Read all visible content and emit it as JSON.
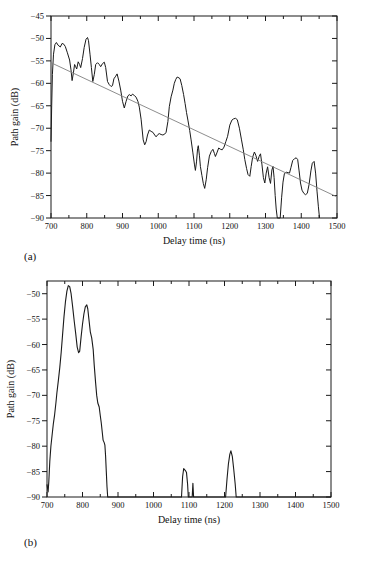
{
  "figure": {
    "panel_a_tag": "(a)",
    "panel_b_tag": "(b)",
    "ink_color": "#1a1a1a",
    "trend_color": "#808080"
  },
  "chart_data": [
    {
      "id": "a",
      "type": "line",
      "title": "",
      "xlabel": "Delay time (ns)",
      "ylabel": "Path gain (dB)",
      "xlim": [
        700,
        1500
      ],
      "ylim": [
        -90,
        -45
      ],
      "grid": false,
      "x_ticks": [
        700,
        800,
        900,
        1000,
        1100,
        1200,
        1300,
        1400,
        1500
      ],
      "x_minor_step": 50,
      "y_ticks": [
        -45,
        -50,
        -55,
        -60,
        -65,
        -70,
        -75,
        -80,
        -85,
        -90
      ],
      "series": [
        {
          "name": "measured-path-gain",
          "color": "#1a1a1a",
          "width": 1,
          "points": [
            [
              700,
              -73
            ],
            [
              702,
              -65
            ],
            [
              704,
              -58
            ],
            [
              707,
              -53.5
            ],
            [
              711,
              -51.4
            ],
            [
              715,
              -50.9
            ],
            [
              720,
              -51.5
            ],
            [
              726,
              -51.9
            ],
            [
              731,
              -51.1
            ],
            [
              736,
              -51.3
            ],
            [
              740,
              -51.8
            ],
            [
              746,
              -53.2
            ],
            [
              752,
              -54.8
            ],
            [
              756,
              -57
            ],
            [
              759,
              -59.4
            ],
            [
              763,
              -57.5
            ],
            [
              766,
              -55.8
            ],
            [
              769,
              -56.3
            ],
            [
              772,
              -56.8
            ],
            [
              776,
              -55.2
            ],
            [
              780,
              -55.8
            ],
            [
              783,
              -56.5
            ],
            [
              788,
              -54.5
            ],
            [
              793,
              -52
            ],
            [
              798,
              -50.2
            ],
            [
              802,
              -49.8
            ],
            [
              805,
              -50.5
            ],
            [
              809,
              -53.5
            ],
            [
              813,
              -56.5
            ],
            [
              817,
              -59.6
            ],
            [
              821,
              -58
            ],
            [
              825,
              -55.8
            ],
            [
              830,
              -55.4
            ],
            [
              835,
              -55.8
            ],
            [
              839,
              -56.3
            ],
            [
              844,
              -55.6
            ],
            [
              849,
              -55.3
            ],
            [
              853,
              -56.5
            ],
            [
              858,
              -59.6
            ],
            [
              863,
              -60.3
            ],
            [
              868,
              -60.7
            ],
            [
              872,
              -60.5
            ],
            [
              876,
              -59
            ],
            [
              881,
              -58.4
            ],
            [
              885,
              -57.9
            ],
            [
              890,
              -59.5
            ],
            [
              895,
              -61.5
            ],
            [
              900,
              -64
            ],
            [
              905,
              -65.5
            ],
            [
              910,
              -64
            ],
            [
              915,
              -62.8
            ],
            [
              919,
              -62.5
            ],
            [
              924,
              -62.8
            ],
            [
              928,
              -62.4
            ],
            [
              933,
              -62.7
            ],
            [
              938,
              -63.1
            ],
            [
              943,
              -64
            ],
            [
              947,
              -65.3
            ],
            [
              952,
              -68
            ],
            [
              958,
              -72.6
            ],
            [
              962,
              -73.7
            ],
            [
              966,
              -73
            ],
            [
              970,
              -71.5
            ],
            [
              975,
              -70.4
            ],
            [
              980,
              -70.7
            ],
            [
              985,
              -70.9
            ],
            [
              990,
              -71.5
            ],
            [
              994,
              -71.9
            ],
            [
              999,
              -71.4
            ],
            [
              1003,
              -71.2
            ],
            [
              1008,
              -71.4
            ],
            [
              1013,
              -71.5
            ],
            [
              1018,
              -71.3
            ],
            [
              1022,
              -70.9
            ],
            [
              1027,
              -68.5
            ],
            [
              1031,
              -65.2
            ],
            [
              1036,
              -63
            ],
            [
              1041,
              -61.5
            ],
            [
              1045,
              -60
            ],
            [
              1049,
              -59.1
            ],
            [
              1053,
              -58.6
            ],
            [
              1058,
              -58.8
            ],
            [
              1061,
              -59
            ],
            [
              1066,
              -60.5
            ],
            [
              1071,
              -62.5
            ],
            [
              1075,
              -64.5
            ],
            [
              1079,
              -66.5
            ],
            [
              1083,
              -68.2
            ],
            [
              1088,
              -70.5
            ],
            [
              1092,
              -72.6
            ],
            [
              1097,
              -75.5
            ],
            [
              1101,
              -78
            ],
            [
              1104,
              -79.4
            ],
            [
              1107,
              -77.5
            ],
            [
              1110,
              -74.5
            ],
            [
              1112,
              -73.9
            ],
            [
              1115,
              -76
            ],
            [
              1118,
              -78.5
            ],
            [
              1122,
              -80.5
            ],
            [
              1126,
              -82.3
            ],
            [
              1130,
              -83.4
            ],
            [
              1134,
              -81.5
            ],
            [
              1138,
              -78.8
            ],
            [
              1143,
              -76.2
            ],
            [
              1148,
              -75.2
            ],
            [
              1153,
              -74.7
            ],
            [
              1157,
              -75.6
            ],
            [
              1160,
              -76.3
            ],
            [
              1164,
              -75.5
            ],
            [
              1169,
              -74.4
            ],
            [
              1174,
              -74.7
            ],
            [
              1179,
              -74.8
            ],
            [
              1184,
              -74.2
            ],
            [
              1189,
              -73
            ],
            [
              1194,
              -71.8
            ],
            [
              1200,
              -69.3
            ],
            [
              1206,
              -68.2
            ],
            [
              1211,
              -67.9
            ],
            [
              1216,
              -67.8
            ],
            [
              1221,
              -68.1
            ],
            [
              1227,
              -70
            ],
            [
              1233,
              -72.6
            ],
            [
              1238,
              -74.8
            ],
            [
              1242,
              -77
            ],
            [
              1247,
              -79
            ],
            [
              1251,
              -80.3
            ],
            [
              1256,
              -80.7
            ],
            [
              1260,
              -78.5
            ],
            [
              1264,
              -76.5
            ],
            [
              1269,
              -75.3
            ],
            [
              1273,
              -76
            ],
            [
              1278,
              -77.4
            ],
            [
              1282,
              -76.3
            ],
            [
              1286,
              -75.7
            ],
            [
              1290,
              -78
            ],
            [
              1294,
              -81
            ],
            [
              1298,
              -82.2
            ],
            [
              1302,
              -80
            ],
            [
              1306,
              -78.6
            ],
            [
              1310,
              -81
            ],
            [
              1314,
              -82.3
            ],
            [
              1318,
              -79.3
            ],
            [
              1321,
              -78.5
            ],
            [
              1324,
              -81
            ],
            [
              1327,
              -85
            ],
            [
              1330,
              -88
            ],
            [
              1333,
              -90
            ],
            [
              1341,
              -90
            ],
            [
              1345,
              -85.5
            ],
            [
              1349,
              -82
            ],
            [
              1353,
              -80.1
            ],
            [
              1358,
              -79.8
            ],
            [
              1363,
              -79.9
            ],
            [
              1367,
              -80
            ],
            [
              1371,
              -78.8
            ],
            [
              1376,
              -77.2
            ],
            [
              1381,
              -76.8
            ],
            [
              1386,
              -76.6
            ],
            [
              1390,
              -77
            ],
            [
              1394,
              -79.5
            ],
            [
              1398,
              -82.2
            ],
            [
              1402,
              -83.8
            ],
            [
              1407,
              -84.5
            ],
            [
              1412,
              -84.8
            ],
            [
              1417,
              -84.5
            ],
            [
              1422,
              -82.5
            ],
            [
              1427,
              -79.5
            ],
            [
              1431,
              -77.8
            ],
            [
              1436,
              -77.4
            ],
            [
              1440,
              -80
            ],
            [
              1444,
              -84
            ],
            [
              1448,
              -87.5
            ],
            [
              1451,
              -90
            ]
          ]
        },
        {
          "name": "regression-trend-line",
          "color": "#808080",
          "width": 0.9,
          "points": [
            [
              700,
              -55.4
            ],
            [
              1500,
              -85.3
            ]
          ]
        }
      ]
    },
    {
      "id": "b",
      "type": "line",
      "title": "",
      "xlabel": "Delay time (ns)",
      "ylabel": "Path gain (dB)",
      "xlim": [
        700,
        1500
      ],
      "ylim": [
        -90,
        -47.5
      ],
      "grid": false,
      "x_ticks": [
        700,
        800,
        900,
        1000,
        1100,
        1200,
        1300,
        1400,
        1500
      ],
      "x_minor_step": 50,
      "y_ticks": [
        -50,
        -55,
        -60,
        -65,
        -70,
        -75,
        -80,
        -85,
        -90
      ],
      "series": [
        {
          "name": "smoothed-power-delay-profile",
          "color": "#1a1a1a",
          "width": 1.1,
          "points": [
            [
              700,
              -87.5
            ],
            [
              703,
              -89
            ],
            [
              705,
              -87
            ],
            [
              708,
              -83
            ],
            [
              711,
              -80
            ],
            [
              714,
              -78
            ],
            [
              718,
              -75.5
            ],
            [
              721,
              -74
            ],
            [
              725,
              -71.5
            ],
            [
              728,
              -69.5
            ],
            [
              732,
              -67
            ],
            [
              736,
              -64.5
            ],
            [
              740,
              -61.5
            ],
            [
              744,
              -58
            ],
            [
              748,
              -54.5
            ],
            [
              752,
              -51.5
            ],
            [
              756,
              -49.5
            ],
            [
              760,
              -48.4
            ],
            [
              764,
              -48.6
            ],
            [
              768,
              -50
            ],
            [
              772,
              -52.5
            ],
            [
              777,
              -55.5
            ],
            [
              781,
              -58
            ],
            [
              785,
              -60.5
            ],
            [
              789,
              -61.6
            ],
            [
              792,
              -61.3
            ],
            [
              796,
              -58.5
            ],
            [
              800,
              -56
            ],
            [
              804,
              -54
            ],
            [
              808,
              -52.6
            ],
            [
              812,
              -52.2
            ],
            [
              815,
              -53
            ],
            [
              818,
              -55
            ],
            [
              822,
              -57.5
            ],
            [
              826,
              -58.7
            ],
            [
              830,
              -61
            ],
            [
              833,
              -64
            ],
            [
              837,
              -67.5
            ],
            [
              840,
              -70
            ],
            [
              843,
              -71.5
            ],
            [
              847,
              -72.3
            ],
            [
              850,
              -74
            ],
            [
              853,
              -75.5
            ],
            [
              856,
              -77.5
            ],
            [
              858,
              -78.8
            ],
            [
              861,
              -79.3
            ],
            [
              863,
              -79.8
            ],
            [
              865,
              -82
            ],
            [
              867,
              -85
            ],
            [
              869,
              -88
            ],
            [
              871,
              -90
            ],
            [
              1079,
              -90
            ],
            [
              1082,
              -86
            ],
            [
              1085,
              -84.4
            ],
            [
              1090,
              -84.8
            ],
            [
              1093,
              -85.2
            ],
            [
              1096,
              -87.5
            ],
            [
              1098,
              -90
            ],
            [
              1109,
              -90
            ],
            [
              1111,
              -87.3
            ],
            [
              1113,
              -90
            ],
            [
              1203,
              -90
            ],
            [
              1207,
              -86.5
            ],
            [
              1211,
              -83.5
            ],
            [
              1215,
              -81.6
            ],
            [
              1218,
              -80.9
            ],
            [
              1222,
              -82
            ],
            [
              1226,
              -84.5
            ],
            [
              1230,
              -87.5
            ],
            [
              1233,
              -90
            ],
            [
              1500,
              -90
            ]
          ]
        }
      ]
    }
  ]
}
